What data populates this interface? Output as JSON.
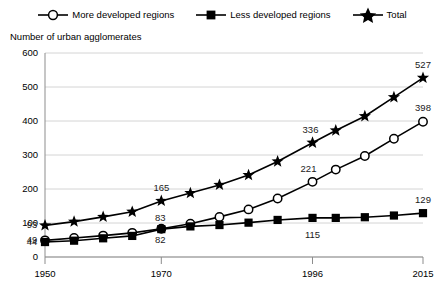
{
  "legend": {
    "items": [
      {
        "label": "More developed regions",
        "marker": "open-circle-icon"
      },
      {
        "label": "Less developed regions",
        "marker": "filled-square-icon"
      },
      {
        "label": "Total",
        "marker": "filled-star-icon"
      }
    ]
  },
  "axis_title": "Number of urban agglomerates",
  "chart_data": {
    "type": "line",
    "title": "",
    "subtitle": "",
    "xlabel": "",
    "ylabel": "Number of urban agglomerates",
    "xlim": [
      1950,
      2015
    ],
    "ylim": [
      0,
      600
    ],
    "ytick_labels": [
      "0",
      "100",
      "200",
      "300",
      "400",
      "500",
      "600"
    ],
    "yticks": [
      0,
      100,
      200,
      300,
      400,
      500,
      600
    ],
    "xtick_labels": [
      "1950",
      "1970",
      "1996",
      "2015"
    ],
    "xticks": [
      1950,
      1970,
      1996,
      2015
    ],
    "grid": true,
    "legend_position": "top",
    "x": [
      1950,
      1955,
      1960,
      1965,
      1970,
      1975,
      1980,
      1985,
      1990,
      1996,
      2000,
      2005,
      2010,
      2015
    ],
    "series": [
      {
        "name": "Total",
        "marker": "filled-star-icon",
        "values": [
          93,
          104,
          118,
          133,
          165,
          188,
          212,
          241,
          281,
          336,
          372,
          414,
          470,
          527
        ]
      },
      {
        "name": "More developed regions",
        "marker": "open-circle-icon",
        "values": [
          49,
          56,
          63,
          71,
          83,
          98,
          118,
          140,
          172,
          221,
          257,
          297,
          348,
          398
        ]
      },
      {
        "name": "Less developed regions",
        "marker": "filled-square-icon",
        "values": [
          44,
          48,
          55,
          62,
          82,
          90,
          94,
          101,
          109,
          115,
          115,
          117,
          122,
          129
        ]
      }
    ],
    "annotations": [
      {
        "text": "93",
        "series": "Total",
        "x": 1950
      },
      {
        "text": "165",
        "series": "Total",
        "x": 1970
      },
      {
        "text": "336",
        "series": "Total",
        "x": 1996
      },
      {
        "text": "527",
        "series": "Total",
        "x": 2015
      },
      {
        "text": "49",
        "series": "More developed regions",
        "x": 1950
      },
      {
        "text": "83",
        "series": "More developed regions",
        "x": 1970
      },
      {
        "text": "221",
        "series": "More developed regions",
        "x": 1996
      },
      {
        "text": "398",
        "series": "More developed regions",
        "x": 2015
      },
      {
        "text": "44",
        "series": "Less developed regions",
        "x": 1950
      },
      {
        "text": "82",
        "series": "Less developed regions",
        "x": 1970
      },
      {
        "text": "115",
        "series": "Less developed regions",
        "x": 1996
      },
      {
        "text": "129",
        "series": "Less developed regions",
        "x": 2015
      }
    ]
  },
  "colors": {
    "ink": "#000000",
    "grid": "#c9c9c9",
    "axis": "#8d8d8d",
    "background": "#ffffff"
  }
}
